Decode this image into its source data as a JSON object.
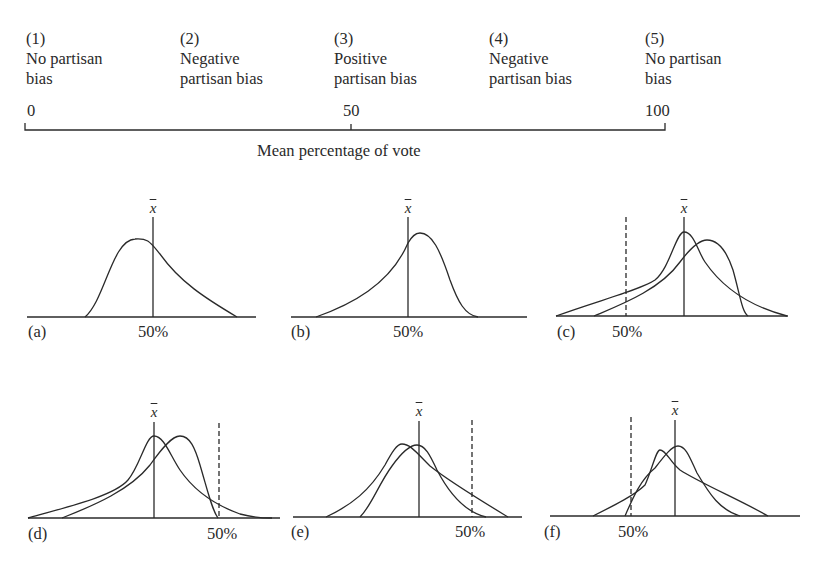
{
  "header": {
    "cutoff_text": "...percentage...",
    "categories": [
      {
        "number": "(1)",
        "line1": "No partisan",
        "line2": "bias"
      },
      {
        "number": "(2)",
        "line1": "Negative",
        "line2": "partisan bias"
      },
      {
        "number": "(3)",
        "line1": "Positive",
        "line2": "partisan bias"
      },
      {
        "number": "(4)",
        "line1": "Negative",
        "line2": "partisan bias"
      },
      {
        "number": "(5)",
        "line1": "No partisan",
        "line2": "bias"
      }
    ],
    "scale": {
      "ticks": [
        "0",
        "50",
        "100"
      ],
      "title": "Mean percentage of vote"
    }
  },
  "panels": {
    "mean_symbol": "x",
    "pct_label": "50%",
    "items": [
      {
        "label": "(a)",
        "description": "single right-skewed curve; 50% at mean"
      },
      {
        "label": "(b)",
        "description": "single left-skewed curve; 50% at mean"
      },
      {
        "label": "(c)",
        "description": "two curves; 50% dashed line left of mean"
      },
      {
        "label": "(d)",
        "description": "two curves; 50% dashed line right of mean"
      },
      {
        "label": "(e)",
        "description": "two curves; 50% dashed line right of mean"
      },
      {
        "label": "(f)",
        "description": "two curves; 50% dashed line left of mean"
      }
    ]
  },
  "colors": {
    "ink": "#2a2a2a",
    "background": "#ffffff"
  }
}
